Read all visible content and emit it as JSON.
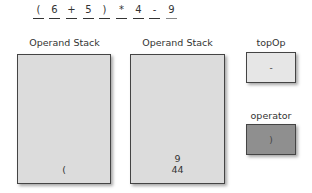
{
  "expression": {
    "tokens": [
      "(",
      "6",
      "+",
      "5",
      ")",
      "*",
      "4",
      "-",
      "9"
    ],
    "positions": [
      33,
      49,
      66,
      83,
      99,
      116,
      133,
      149,
      149
    ]
  },
  "stacks": [
    {
      "label": "Operand Stack",
      "items": [
        "("
      ]
    },
    {
      "label": "Operand Stack",
      "items": [
        "9",
        "44"
      ]
    }
  ],
  "topOp": {
    "label": "topOp",
    "value": "-",
    "color": "#e6e6e6"
  },
  "operator": {
    "label": "operator",
    "value": ")",
    "color": "#8f8f8f"
  }
}
